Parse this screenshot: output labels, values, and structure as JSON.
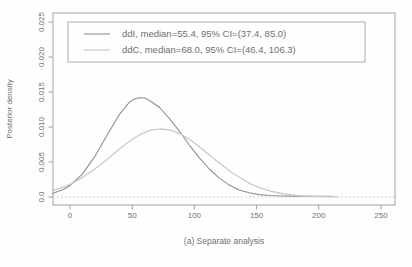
{
  "figure": {
    "caption": "(a) Separate analysis",
    "y_axis_title": "Posterior density"
  },
  "legend": {
    "entries": [
      {
        "label": "ddI, median=55.4, 95% CI=(37.4, 85.0)"
      },
      {
        "label": "ddC, median=68.0, 95% CI=(46.4, 106.3)"
      }
    ]
  },
  "colors": {
    "ddI_curve": "#909090",
    "ddC_curve": "#c9c9c9",
    "axis": "#a2a2a2",
    "text": "#6f6f6f",
    "zero_line": "#bdbdbd",
    "legend_border": "#aaaaaa"
  },
  "chart_data": {
    "type": "line",
    "title": "",
    "xlabel": "(a) Separate analysis",
    "ylabel": "Posterior density",
    "xlim": [
      -13.7,
      261.3
    ],
    "ylim": [
      -0.00114,
      0.0263
    ],
    "grid": false,
    "legend_position": "top-left-inside",
    "x_ticks": {
      "values": [
        0,
        50,
        100,
        150,
        200,
        250
      ],
      "labels": [
        "0",
        "50",
        "100",
        "150",
        "200",
        "250"
      ]
    },
    "y_ticks": {
      "values": [
        0,
        0.005,
        0.01,
        0.015,
        0.02,
        0.025
      ],
      "labels": [
        "0.0",
        "0.005",
        "0.010",
        "0.015",
        "0.020",
        "0.025"
      ]
    },
    "zero_reference_line": {
      "y": 0,
      "style": "dotted",
      "color": "#bdbdbd"
    },
    "series": [
      {
        "name": "ddI",
        "median": 55.4,
        "ci95": [
          37.4,
          85.0
        ],
        "peak": {
          "x": 56,
          "density": 0.0142
        },
        "color": "#909090",
        "style": "solid",
        "points": [
          [
            -14,
            0.0005
          ],
          [
            -5,
            0.0011
          ],
          [
            0,
            0.00165
          ],
          [
            10,
            0.0033
          ],
          [
            20,
            0.0058
          ],
          [
            30,
            0.0089
          ],
          [
            40,
            0.0119
          ],
          [
            48,
            0.0136
          ],
          [
            52,
            0.01405
          ],
          [
            56,
            0.0142
          ],
          [
            60,
            0.01415
          ],
          [
            64,
            0.0138
          ],
          [
            72,
            0.0128
          ],
          [
            80,
            0.0112
          ],
          [
            88,
            0.0094
          ],
          [
            96,
            0.0074
          ],
          [
            104,
            0.0056
          ],
          [
            112,
            0.004
          ],
          [
            120,
            0.0027
          ],
          [
            128,
            0.0017
          ],
          [
            136,
            0.001
          ],
          [
            144,
            0.0006
          ],
          [
            152,
            0.00035
          ],
          [
            160,
            0.00022
          ],
          [
            170,
            0.00015
          ],
          [
            180,
            0.00013
          ],
          [
            190,
            0.00012
          ],
          [
            200,
            0.00012
          ],
          [
            210,
            0.00012
          ]
        ]
      },
      {
        "name": "ddC",
        "median": 68.0,
        "ci95": [
          46.4,
          106.3
        ],
        "peak": {
          "x": 73,
          "density": 0.0097
        },
        "color": "#c9c9c9",
        "style": "solid",
        "points": [
          [
            -14,
            0.0009
          ],
          [
            -5,
            0.00145
          ],
          [
            0,
            0.0018
          ],
          [
            10,
            0.0028
          ],
          [
            20,
            0.004
          ],
          [
            30,
            0.0054
          ],
          [
            40,
            0.0069
          ],
          [
            48,
            0.008
          ],
          [
            56,
            0.0089
          ],
          [
            64,
            0.0095
          ],
          [
            68,
            0.00962
          ],
          [
            73,
            0.0097
          ],
          [
            78,
            0.00962
          ],
          [
            82,
            0.0095
          ],
          [
            90,
            0.0089
          ],
          [
            98,
            0.008
          ],
          [
            106,
            0.0069
          ],
          [
            114,
            0.0057
          ],
          [
            122,
            0.0046
          ],
          [
            130,
            0.0035
          ],
          [
            138,
            0.0026
          ],
          [
            146,
            0.0018
          ],
          [
            154,
            0.00125
          ],
          [
            162,
            0.00082
          ],
          [
            170,
            0.00051
          ],
          [
            178,
            0.00031
          ],
          [
            186,
            0.00018
          ],
          [
            196,
            9e-05
          ],
          [
            206,
            5e-05
          ],
          [
            215,
            3e-05
          ]
        ]
      }
    ]
  }
}
